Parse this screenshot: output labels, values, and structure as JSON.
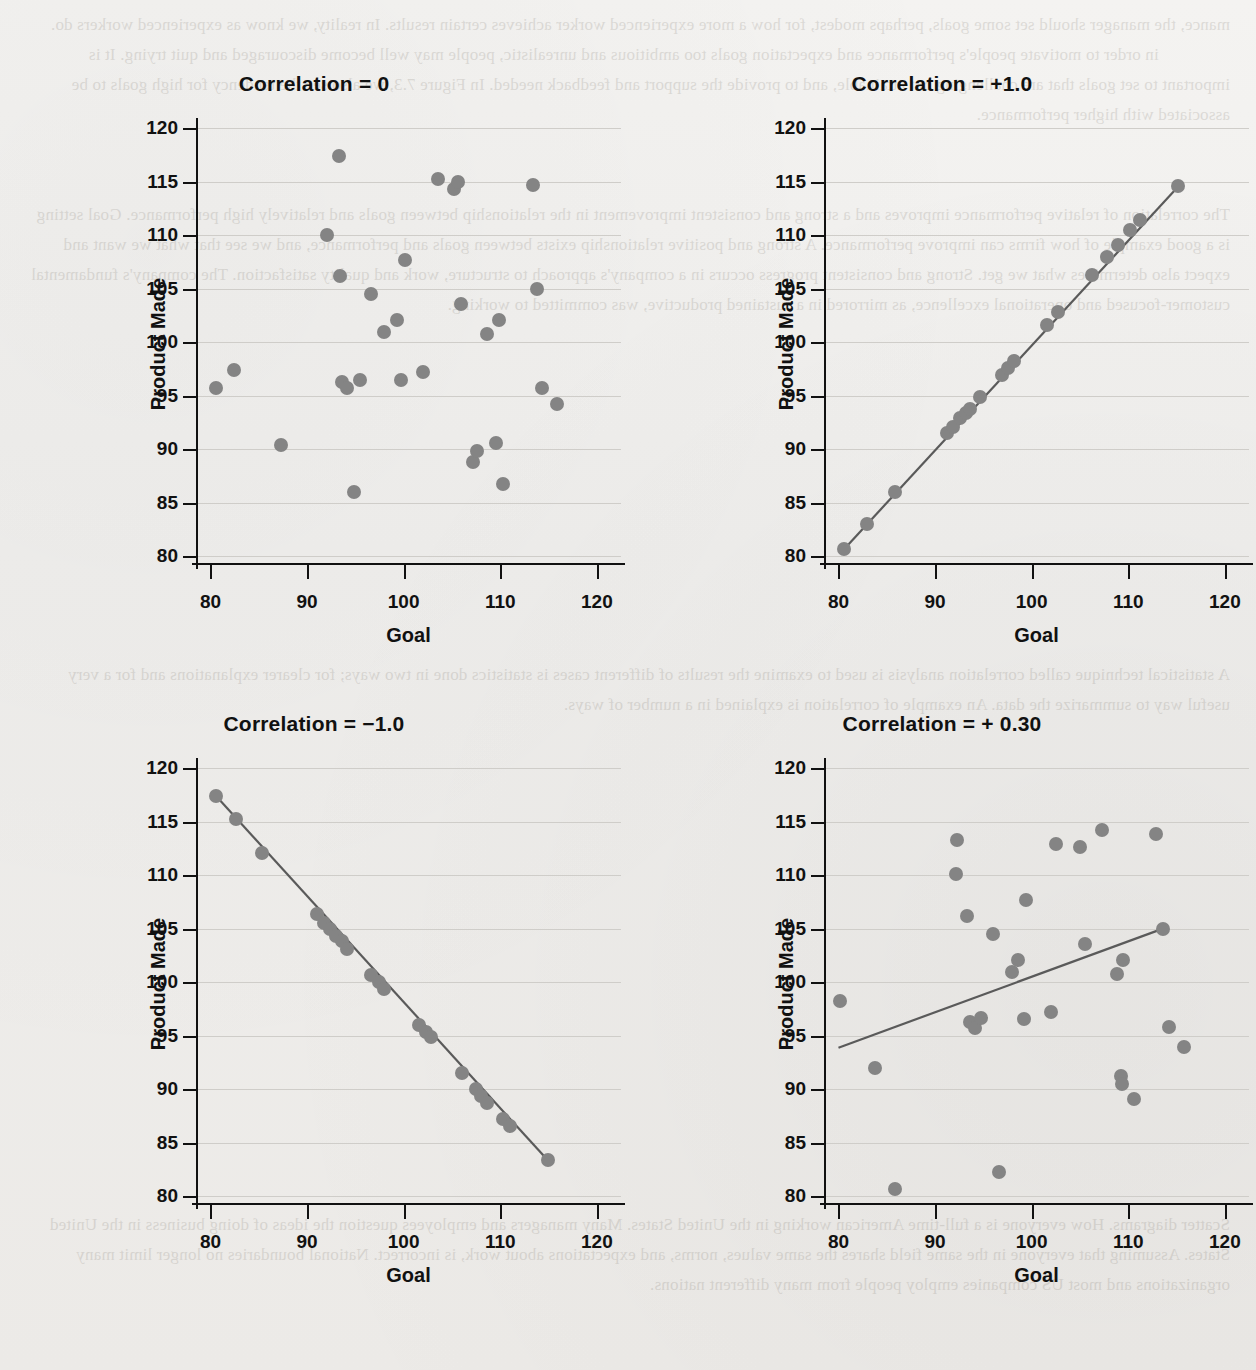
{
  "page": {
    "background_color": "#f2f1ef",
    "marker_color": "#848484",
    "line_color": "#5a5a5a",
    "axis_color": "#111111",
    "gridline_color": "#cfcdc9",
    "showthrough_text_top": "mance, the manager should set some goals, perhaps modest, for how a more experienced worker achieves certain results. In reality, we know as experienced workers do.\n                in order to motivate people's performance and expectation goals too ambitious and unrealistic, people may well become discouraged and quit trying. It is important to set goals that are challenging but attainable, and to provide the support and feedback needed. In Figure 7.3, we also see the tendency for high goals to be associated with higher performance.",
    "showthrough_text_mid": "The correlation of relative performance improves and a strong and consistent improvement in the relationship between goals and relatively high performance. Goal setting is a good example of how firms can improve performance. A strong and positive relationship exists between goals and performance, and we see that what we want and expect also determines what we get. Strong and consistent progress occurs in a company's approach to structure, work and quality satisfaction. The company's fundamental customer-focused and operational excellence, as mirrored in a sustained productive, was committed to working.",
    "showthrough_text_bottom": "A statistical technique called correlation analysis is used to examine the results of different cases is statistics done in two ways; for clearer explanations and for a very useful way to summarize the data. An example of correlation is explained in a number of ways.",
    "showthrough_text_footer": "Scatter diagrams. How everyone is a full-time American working in the United States. Many managers and employees question the ideas of doing business in the United States. Assuming that everyone in the same field shares the same values, norms, and expectations about work, is incorrect. National boundaries no longer limit many organizations and most US companies employ people from many different nations."
  },
  "axes": {
    "x": {
      "label": "Goal",
      "ticks": [
        80,
        90,
        100,
        110,
        120
      ],
      "min": 78.5,
      "max": 122.5
    },
    "y": {
      "label": "Product Made",
      "ticks": [
        80,
        85,
        90,
        95,
        100,
        105,
        110,
        115,
        120
      ],
      "min": 79.2,
      "max": 120.6
    }
  },
  "chart_data": [
    {
      "id": "panel-correlation-zero",
      "type": "scatter",
      "title": "Correlation = 0",
      "correlation": 0,
      "xlabel": "Goal",
      "ylabel": "Product Made",
      "xlim": [
        78.5,
        122.5
      ],
      "ylim": [
        79.2,
        120.6
      ],
      "grid": true,
      "trendline": null,
      "points": [
        {
          "x": 80.6,
          "y": 95.7
        },
        {
          "x": 82.4,
          "y": 97.4
        },
        {
          "x": 87.3,
          "y": 90.4
        },
        {
          "x": 92.1,
          "y": 110.0
        },
        {
          "x": 93.3,
          "y": 117.4
        },
        {
          "x": 93.4,
          "y": 106.2
        },
        {
          "x": 93.6,
          "y": 96.3
        },
        {
          "x": 94.1,
          "y": 95.7
        },
        {
          "x": 94.9,
          "y": 86.0
        },
        {
          "x": 95.5,
          "y": 96.5
        },
        {
          "x": 96.6,
          "y": 104.5
        },
        {
          "x": 98.0,
          "y": 101.0
        },
        {
          "x": 99.3,
          "y": 102.1
        },
        {
          "x": 99.7,
          "y": 96.5
        },
        {
          "x": 100.1,
          "y": 107.7
        },
        {
          "x": 102.0,
          "y": 97.2
        },
        {
          "x": 103.6,
          "y": 115.3
        },
        {
          "x": 105.2,
          "y": 114.3
        },
        {
          "x": 105.6,
          "y": 115.0
        },
        {
          "x": 105.9,
          "y": 103.6
        },
        {
          "x": 107.2,
          "y": 88.8
        },
        {
          "x": 107.6,
          "y": 89.9
        },
        {
          "x": 108.6,
          "y": 100.8
        },
        {
          "x": 109.6,
          "y": 90.6
        },
        {
          "x": 109.9,
          "y": 102.1
        },
        {
          "x": 110.3,
          "y": 86.8
        },
        {
          "x": 113.4,
          "y": 114.7
        },
        {
          "x": 113.8,
          "y": 105.0
        },
        {
          "x": 114.3,
          "y": 95.7
        },
        {
          "x": 115.9,
          "y": 94.2
        }
      ]
    },
    {
      "id": "panel-correlation-positive-one",
      "type": "scatter",
      "title": "Correlation = +1.0",
      "correlation": 1.0,
      "xlabel": "Goal",
      "ylabel": "Product Made",
      "xlim": [
        78.5,
        122.5
      ],
      "ylim": [
        79.2,
        120.6
      ],
      "grid": true,
      "trendline": {
        "x1": 80.6,
        "y1": 80.7,
        "x2": 115.2,
        "y2": 114.6
      },
      "points": [
        {
          "x": 80.6,
          "y": 80.7
        },
        {
          "x": 82.9,
          "y": 83.0
        },
        {
          "x": 85.9,
          "y": 86.0
        },
        {
          "x": 91.2,
          "y": 91.5
        },
        {
          "x": 91.9,
          "y": 92.1
        },
        {
          "x": 92.6,
          "y": 92.9
        },
        {
          "x": 93.2,
          "y": 93.4
        },
        {
          "x": 93.6,
          "y": 93.8
        },
        {
          "x": 94.6,
          "y": 94.9
        },
        {
          "x": 96.9,
          "y": 97.0
        },
        {
          "x": 97.6,
          "y": 97.6
        },
        {
          "x": 98.2,
          "y": 98.3
        },
        {
          "x": 101.6,
          "y": 101.6
        },
        {
          "x": 102.7,
          "y": 102.8
        },
        {
          "x": 106.2,
          "y": 106.3
        },
        {
          "x": 107.8,
          "y": 108.0
        },
        {
          "x": 108.9,
          "y": 109.1
        },
        {
          "x": 110.2,
          "y": 110.5
        },
        {
          "x": 111.2,
          "y": 111.4
        },
        {
          "x": 115.2,
          "y": 114.6
        }
      ]
    },
    {
      "id": "panel-correlation-negative-one",
      "type": "scatter",
      "title": "Correlation = −1.0",
      "correlation": -1.0,
      "xlabel": "Goal",
      "ylabel": "Product Made",
      "xlim": [
        78.5,
        122.5
      ],
      "ylim": [
        79.2,
        120.6
      ],
      "grid": true,
      "trendline": {
        "x1": 80.6,
        "y1": 117.4,
        "x2": 114.9,
        "y2": 83.4
      },
      "points": [
        {
          "x": 80.6,
          "y": 117.4
        },
        {
          "x": 82.6,
          "y": 115.3
        },
        {
          "x": 85.3,
          "y": 112.1
        },
        {
          "x": 91.0,
          "y": 106.4
        },
        {
          "x": 91.7,
          "y": 105.6
        },
        {
          "x": 92.4,
          "y": 105.0
        },
        {
          "x": 93.0,
          "y": 104.3
        },
        {
          "x": 93.6,
          "y": 103.9
        },
        {
          "x": 94.1,
          "y": 103.1
        },
        {
          "x": 96.6,
          "y": 100.7
        },
        {
          "x": 97.4,
          "y": 100.0
        },
        {
          "x": 98.0,
          "y": 99.4
        },
        {
          "x": 101.6,
          "y": 96.0
        },
        {
          "x": 102.3,
          "y": 95.4
        },
        {
          "x": 102.8,
          "y": 94.9
        },
        {
          "x": 106.0,
          "y": 91.5
        },
        {
          "x": 107.5,
          "y": 90.0
        },
        {
          "x": 108.0,
          "y": 89.4
        },
        {
          "x": 108.6,
          "y": 88.7
        },
        {
          "x": 110.3,
          "y": 87.2
        },
        {
          "x": 111.0,
          "y": 86.6
        },
        {
          "x": 114.9,
          "y": 83.4
        }
      ]
    },
    {
      "id": "panel-correlation-positive-point-three",
      "type": "scatter",
      "title": "Correlation = + 0.30",
      "correlation": 0.3,
      "xlabel": "Goal",
      "ylabel": "Product Made",
      "xlim": [
        78.5,
        122.5
      ],
      "ylim": [
        79.2,
        120.6
      ],
      "grid": true,
      "trendline": {
        "x1": 80.0,
        "y1": 93.9,
        "x2": 113.8,
        "y2": 105.1
      },
      "points": [
        {
          "x": 80.2,
          "y": 98.3
        },
        {
          "x": 83.8,
          "y": 92.0
        },
        {
          "x": 85.9,
          "y": 80.7
        },
        {
          "x": 92.3,
          "y": 113.3
        },
        {
          "x": 92.2,
          "y": 110.1
        },
        {
          "x": 93.3,
          "y": 106.2
        },
        {
          "x": 93.6,
          "y": 96.3
        },
        {
          "x": 94.1,
          "y": 95.7
        },
        {
          "x": 94.8,
          "y": 96.7
        },
        {
          "x": 96.0,
          "y": 104.5
        },
        {
          "x": 96.6,
          "y": 82.3
        },
        {
          "x": 98.0,
          "y": 101.0
        },
        {
          "x": 98.6,
          "y": 102.1
        },
        {
          "x": 99.2,
          "y": 96.6
        },
        {
          "x": 99.4,
          "y": 107.7
        },
        {
          "x": 102.0,
          "y": 97.2
        },
        {
          "x": 102.5,
          "y": 112.9
        },
        {
          "x": 105.0,
          "y": 112.7
        },
        {
          "x": 105.5,
          "y": 103.6
        },
        {
          "x": 107.3,
          "y": 114.2
        },
        {
          "x": 108.8,
          "y": 100.8
        },
        {
          "x": 109.2,
          "y": 91.3
        },
        {
          "x": 109.3,
          "y": 90.5
        },
        {
          "x": 109.5,
          "y": 102.1
        },
        {
          "x": 110.6,
          "y": 89.1
        },
        {
          "x": 112.9,
          "y": 113.9
        },
        {
          "x": 113.6,
          "y": 105.0
        },
        {
          "x": 114.2,
          "y": 95.8
        },
        {
          "x": 115.8,
          "y": 94.0
        }
      ]
    }
  ]
}
